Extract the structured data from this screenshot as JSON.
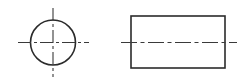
{
  "drawing": {
    "title": "Orthographic projection of a cylinder",
    "sheet": {
      "width": 245,
      "height": 83,
      "background": "#ffffff"
    },
    "style": {
      "outline_color": "#2b2b2b",
      "centerline_color": "#3a3a3a",
      "outline_width": 1.6,
      "centerline_width": 1.1,
      "centerline_dash": "long-dash short-dash"
    },
    "views": [
      {
        "name": "front-view",
        "type": "circle",
        "label": "",
        "geometry": {
          "center_x": 53,
          "center_y": 42.5,
          "radius": 22.5,
          "diameter": 45
        },
        "centerlines": [
          {
            "name": "horizontal-centerline",
            "orientation": "horizontal",
            "x1": 18,
            "y1": 42.5,
            "x2": 89,
            "y2": 42.5
          },
          {
            "name": "vertical-centerline",
            "orientation": "vertical",
            "x1": 53,
            "y1": 8,
            "x2": 53,
            "y2": 77
          }
        ]
      },
      {
        "name": "side-view",
        "type": "rectangle",
        "label": "",
        "geometry": {
          "x": 131,
          "y": 16,
          "width": 94,
          "height": 52,
          "right": 225,
          "bottom": 68
        },
        "centerlines": [
          {
            "name": "horizontal-centerline",
            "orientation": "horizontal",
            "x1": 121,
            "y1": 42.5,
            "x2": 237,
            "y2": 42.5
          }
        ]
      }
    ]
  }
}
